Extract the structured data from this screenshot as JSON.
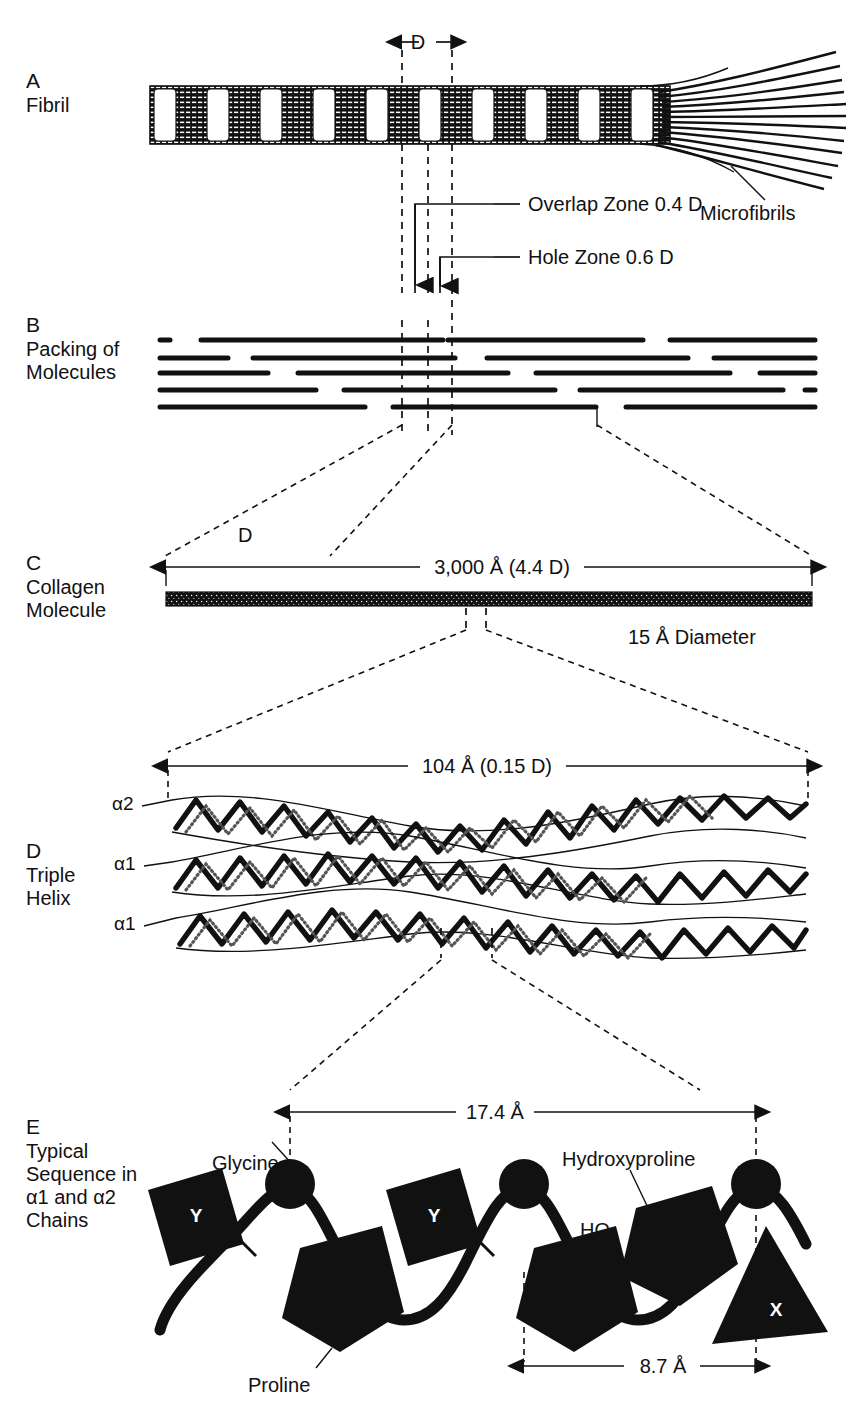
{
  "figure": {
    "panels": [
      {
        "letter": "A",
        "name": "Fibril",
        "name_lines": [
          "Fibril"
        ],
        "callouts": [
          {
            "id": "overlap",
            "text": "Overlap Zone 0.4 D"
          },
          {
            "id": "hole",
            "text": "Hole Zone 0.6 D"
          },
          {
            "id": "microfibrils",
            "text": "Microfibrils"
          }
        ],
        "dimensions": [
          {
            "id": "d-period",
            "label": "D"
          }
        ]
      },
      {
        "letter": "B",
        "name": "Packing of Molecules",
        "name_lines": [
          "Packing of",
          "Molecules"
        ],
        "rows": 5
      },
      {
        "letter": "C",
        "name": "Collagen Molecule",
        "name_lines": [
          "Collagen",
          "Molecule"
        ],
        "dimensions": [
          {
            "id": "length",
            "label": "3,000 Å (4.4 D)"
          },
          {
            "id": "d-mark",
            "label": "D"
          },
          {
            "id": "diameter",
            "label": "15 Å Diameter"
          }
        ]
      },
      {
        "letter": "D",
        "name": "Triple Helix",
        "name_lines": [
          "Triple",
          "Helix"
        ],
        "chains": [
          "α2",
          "α1",
          "α1"
        ],
        "dimensions": [
          {
            "id": "pitch",
            "label": "104 Å (0.15 D)"
          }
        ]
      },
      {
        "letter": "E",
        "name": "Typical Sequence in α1 and α2 Chains",
        "name_lines": [
          "Typical",
          "Sequence in",
          "α1 and α2",
          "Chains"
        ],
        "callouts": [
          {
            "id": "glycine",
            "text": "Glycine"
          },
          {
            "id": "hydroxyproline",
            "text": "Hydroxyproline"
          },
          {
            "id": "proline",
            "text": "Proline"
          },
          {
            "id": "hydroxyl",
            "text": "HO"
          }
        ],
        "residue_glyphs": [
          "Y",
          "Y",
          "X"
        ],
        "dimensions": [
          {
            "id": "triplet",
            "label": "17.4 Å"
          },
          {
            "id": "rise",
            "label": "8.7 Å"
          }
        ]
      }
    ]
  },
  "colors": {
    "ink": "#111111",
    "background": "#ffffff"
  }
}
